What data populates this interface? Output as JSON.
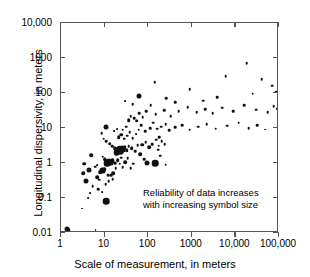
{
  "chart_data": {
    "type": "scatter",
    "title": "",
    "xlabel": "Scale of measurement, in meters",
    "ylabel": "Longitudinal dispersivity, in meters",
    "xscale": "log",
    "yscale": "log",
    "xlim": [
      1,
      100000
    ],
    "ylim": [
      0.01,
      10000
    ],
    "grid": false,
    "legend": "none",
    "xticks": [
      "1",
      "10",
      "100",
      "1000",
      "10,000",
      "100,000"
    ],
    "xtick_values": [
      1,
      10,
      100,
      1000,
      10000,
      100000
    ],
    "yticks": [
      "0.01",
      "0.1",
      "1",
      "10",
      "100",
      "1000",
      "10,000"
    ],
    "ytick_values": [
      0.01,
      0.1,
      1,
      10,
      100,
      1000,
      10000
    ],
    "annotations": [
      {
        "line1": "Reliability of data increases",
        "line2": "with increasing symbol size"
      }
    ],
    "symbol_size_meaning": "Reliability of data increases with increasing symbol size",
    "marker_color": "#111111",
    "size_classes": [
      1.8,
      2.6,
      3.6,
      5.0,
      6.6
    ],
    "points": [
      {
        "x": 1.4,
        "y": 0.013,
        "s": 5.0
      },
      {
        "x": 1.5,
        "y": 0.012,
        "s": 3.6
      },
      {
        "x": 3.0,
        "y": 0.05,
        "s": 1.8
      },
      {
        "x": 6.2,
        "y": 0.012,
        "s": 1.8
      },
      {
        "x": 4.2,
        "y": 0.1,
        "s": 1.8
      },
      {
        "x": 4.6,
        "y": 0.14,
        "s": 1.8
      },
      {
        "x": 5.3,
        "y": 0.22,
        "s": 2.6
      },
      {
        "x": 11.0,
        "y": 0.082,
        "s": 6.6
      },
      {
        "x": 6.8,
        "y": 0.4,
        "s": 3.6
      },
      {
        "x": 3.2,
        "y": 0.52,
        "s": 3.6
      },
      {
        "x": 3.4,
        "y": 0.95,
        "s": 3.6
      },
      {
        "x": 7.5,
        "y": 0.33,
        "s": 2.6
      },
      {
        "x": 8.0,
        "y": 0.55,
        "s": 3.6
      },
      {
        "x": 8.6,
        "y": 0.62,
        "s": 5.0
      },
      {
        "x": 9.2,
        "y": 0.58,
        "s": 5.0
      },
      {
        "x": 9.8,
        "y": 0.66,
        "s": 3.6
      },
      {
        "x": 6.0,
        "y": 0.78,
        "s": 2.6
      },
      {
        "x": 6.6,
        "y": 0.88,
        "s": 1.8
      },
      {
        "x": 10.5,
        "y": 0.25,
        "s": 2.6
      },
      {
        "x": 12.5,
        "y": 0.3,
        "s": 2.6
      },
      {
        "x": 14.0,
        "y": 0.44,
        "s": 2.6
      },
      {
        "x": 16.0,
        "y": 0.52,
        "s": 3.6
      },
      {
        "x": 18.0,
        "y": 0.7,
        "s": 2.6
      },
      {
        "x": 11.5,
        "y": 1.0,
        "s": 6.6
      },
      {
        "x": 12.2,
        "y": 1.05,
        "s": 6.6
      },
      {
        "x": 13.0,
        "y": 1.1,
        "s": 6.6
      },
      {
        "x": 13.8,
        "y": 0.98,
        "s": 5.0
      },
      {
        "x": 14.6,
        "y": 1.15,
        "s": 5.0
      },
      {
        "x": 15.5,
        "y": 1.25,
        "s": 3.6
      },
      {
        "x": 10.0,
        "y": 1.3,
        "s": 3.6
      },
      {
        "x": 9.0,
        "y": 1.5,
        "s": 2.6
      },
      {
        "x": 17.5,
        "y": 1.0,
        "s": 2.6
      },
      {
        "x": 20.0,
        "y": 1.2,
        "s": 3.6
      },
      {
        "x": 22.0,
        "y": 0.95,
        "s": 2.6
      },
      {
        "x": 24.0,
        "y": 1.4,
        "s": 2.6
      },
      {
        "x": 26.0,
        "y": 0.75,
        "s": 2.6
      },
      {
        "x": 30.0,
        "y": 1.05,
        "s": 3.6
      },
      {
        "x": 34.0,
        "y": 1.35,
        "s": 2.6
      },
      {
        "x": 40.0,
        "y": 0.7,
        "s": 2.6
      },
      {
        "x": 46.0,
        "y": 0.95,
        "s": 2.6
      },
      {
        "x": 95.0,
        "y": 1.0,
        "s": 5.0
      },
      {
        "x": 145.0,
        "y": 1.0,
        "s": 6.6
      },
      {
        "x": 19.0,
        "y": 2.0,
        "s": 6.6
      },
      {
        "x": 20.5,
        "y": 2.3,
        "s": 6.6
      },
      {
        "x": 22.0,
        "y": 2.5,
        "s": 6.6
      },
      {
        "x": 23.5,
        "y": 2.2,
        "s": 6.6
      },
      {
        "x": 25.0,
        "y": 2.6,
        "s": 5.0
      },
      {
        "x": 27.0,
        "y": 2.4,
        "s": 5.0
      },
      {
        "x": 29.0,
        "y": 2.8,
        "s": 3.6
      },
      {
        "x": 17.0,
        "y": 2.6,
        "s": 3.6
      },
      {
        "x": 15.0,
        "y": 3.0,
        "s": 2.6
      },
      {
        "x": 13.0,
        "y": 3.6,
        "s": 3.6
      },
      {
        "x": 11.0,
        "y": 4.2,
        "s": 2.6
      },
      {
        "x": 9.5,
        "y": 5.0,
        "s": 2.6
      },
      {
        "x": 32.0,
        "y": 2.3,
        "s": 3.6
      },
      {
        "x": 36.0,
        "y": 3.0,
        "s": 2.6
      },
      {
        "x": 42.0,
        "y": 2.6,
        "s": 3.6
      },
      {
        "x": 50.0,
        "y": 2.2,
        "s": 2.6
      },
      {
        "x": 58.0,
        "y": 3.2,
        "s": 2.6
      },
      {
        "x": 21.0,
        "y": 5.5,
        "s": 3.6
      },
      {
        "x": 24.0,
        "y": 6.5,
        "s": 3.6
      },
      {
        "x": 28.0,
        "y": 5.0,
        "s": 2.6
      },
      {
        "x": 33.0,
        "y": 6.0,
        "s": 2.6
      },
      {
        "x": 38.0,
        "y": 7.5,
        "s": 2.6
      },
      {
        "x": 44.0,
        "y": 5.2,
        "s": 2.6
      },
      {
        "x": 52.0,
        "y": 6.8,
        "s": 1.8
      },
      {
        "x": 16.5,
        "y": 8.0,
        "s": 1.8
      },
      {
        "x": 19.5,
        "y": 9.5,
        "s": 1.8
      },
      {
        "x": 26.0,
        "y": 9.0,
        "s": 2.6
      },
      {
        "x": 31.0,
        "y": 11.0,
        "s": 2.6
      },
      {
        "x": 10.5,
        "y": 11.0,
        "s": 5.0
      },
      {
        "x": 8.5,
        "y": 7.0,
        "s": 2.6
      },
      {
        "x": 60.0,
        "y": 9.0,
        "s": 2.6
      },
      {
        "x": 70.0,
        "y": 12.0,
        "s": 2.6
      },
      {
        "x": 85.0,
        "y": 8.0,
        "s": 2.6
      },
      {
        "x": 110.0,
        "y": 10.0,
        "s": 2.6
      },
      {
        "x": 130.0,
        "y": 14.0,
        "s": 2.6
      },
      {
        "x": 160.0,
        "y": 9.5,
        "s": 2.6
      },
      {
        "x": 200.0,
        "y": 11.0,
        "s": 2.6
      },
      {
        "x": 250.0,
        "y": 13.0,
        "s": 2.6
      },
      {
        "x": 300.0,
        "y": 8.5,
        "s": 2.6
      },
      {
        "x": 420.0,
        "y": 10.5,
        "s": 2.6
      },
      {
        "x": 600.0,
        "y": 12.0,
        "s": 2.6
      },
      {
        "x": 900.0,
        "y": 9.0,
        "s": 2.6
      },
      {
        "x": 1400.0,
        "y": 11.0,
        "s": 2.6
      },
      {
        "x": 2200.0,
        "y": 13.0,
        "s": 2.6
      },
      {
        "x": 3500.0,
        "y": 9.5,
        "s": 2.6
      },
      {
        "x": 6500.0,
        "y": 11.5,
        "s": 2.6
      },
      {
        "x": 12000.0,
        "y": 14.0,
        "s": 2.6
      },
      {
        "x": 20000.0,
        "y": 10.0,
        "s": 2.6
      },
      {
        "x": 32000.0,
        "y": 12.0,
        "s": 2.6
      },
      {
        "x": 48000.0,
        "y": 9.0,
        "s": 1.8
      },
      {
        "x": 150.0,
        "y": 25.0,
        "s": 2.6
      },
      {
        "x": 230.0,
        "y": 32.0,
        "s": 2.6
      },
      {
        "x": 330.0,
        "y": 22.0,
        "s": 2.6
      },
      {
        "x": 500.0,
        "y": 30.0,
        "s": 2.6
      },
      {
        "x": 800.0,
        "y": 40.0,
        "s": 2.6
      },
      {
        "x": 1300.0,
        "y": 28.0,
        "s": 2.6
      },
      {
        "x": 2000.0,
        "y": 35.0,
        "s": 2.6
      },
      {
        "x": 3000.0,
        "y": 26.0,
        "s": 2.6
      },
      {
        "x": 5000.0,
        "y": 38.0,
        "s": 2.6
      },
      {
        "x": 9000.0,
        "y": 30.0,
        "s": 2.6
      },
      {
        "x": 16000.0,
        "y": 45.0,
        "s": 2.6
      },
      {
        "x": 30000.0,
        "y": 33.0,
        "s": 2.6
      },
      {
        "x": 55000.0,
        "y": 28.0,
        "s": 2.6
      },
      {
        "x": 75000.0,
        "y": 42.0,
        "s": 2.6
      },
      {
        "x": 90000.0,
        "y": 36.0,
        "s": 2.6
      },
      {
        "x": 62.0,
        "y": 80.0,
        "s": 5.0
      },
      {
        "x": 140.0,
        "y": 200.0,
        "s": 2.6
      },
      {
        "x": 900.0,
        "y": 130.0,
        "s": 2.6
      },
      {
        "x": 6000.0,
        "y": 300.0,
        "s": 2.6
      },
      {
        "x": 18000.0,
        "y": 700.0,
        "s": 2.6
      },
      {
        "x": 40000.0,
        "y": 250.0,
        "s": 2.6
      },
      {
        "x": 70000.0,
        "y": 160.0,
        "s": 2.6
      },
      {
        "x": 85000.0,
        "y": 110.0,
        "s": 2.6
      },
      {
        "x": 25000.0,
        "y": 95.0,
        "s": 2.6
      },
      {
        "x": 3800.0,
        "y": 75.0,
        "s": 2.6
      },
      {
        "x": 1800.0,
        "y": 60.0,
        "s": 2.6
      },
      {
        "x": 420.0,
        "y": 55.0,
        "s": 2.6
      },
      {
        "x": 260.0,
        "y": 70.0,
        "s": 2.6
      },
      {
        "x": 75.0,
        "y": 20.0,
        "s": 2.6
      },
      {
        "x": 55.0,
        "y": 16.0,
        "s": 3.6
      },
      {
        "x": 48.0,
        "y": 19.0,
        "s": 2.6
      },
      {
        "x": 40.0,
        "y": 22.0,
        "s": 2.6
      },
      {
        "x": 36.0,
        "y": 17.0,
        "s": 3.6
      },
      {
        "x": 62.0,
        "y": 26.0,
        "s": 2.6
      },
      {
        "x": 90.0,
        "y": 30.0,
        "s": 2.6
      },
      {
        "x": 115.0,
        "y": 45.0,
        "s": 2.6
      },
      {
        "x": 44.0,
        "y": 48.0,
        "s": 2.6
      },
      {
        "x": 30.0,
        "y": 60.0,
        "s": 1.8
      },
      {
        "x": 250.0,
        "y": 0.9,
        "s": 2.6
      },
      {
        "x": 190.0,
        "y": 1.6,
        "s": 2.6
      },
      {
        "x": 170.0,
        "y": 2.4,
        "s": 2.6
      },
      {
        "x": 175.0,
        "y": 3.1,
        "s": 2.6
      },
      {
        "x": 205.0,
        "y": 4.2,
        "s": 2.6
      },
      {
        "x": 240.0,
        "y": 3.4,
        "s": 2.6
      },
      {
        "x": 180.0,
        "y": 5.5,
        "s": 2.6
      },
      {
        "x": 155.0,
        "y": 4.6,
        "s": 2.6
      },
      {
        "x": 125.0,
        "y": 3.5,
        "s": 2.6
      },
      {
        "x": 105.0,
        "y": 2.8,
        "s": 3.6
      },
      {
        "x": 88.0,
        "y": 4.0,
        "s": 2.6
      },
      {
        "x": 72.0,
        "y": 3.3,
        "s": 3.6
      },
      {
        "x": 66.0,
        "y": 1.8,
        "s": 3.6
      },
      {
        "x": 80.0,
        "y": 1.3,
        "s": 2.6
      },
      {
        "x": 5.0,
        "y": 1.7,
        "s": 3.6
      },
      {
        "x": 4.4,
        "y": 0.62,
        "s": 5.0
      },
      {
        "x": 3.8,
        "y": 0.3,
        "s": 5.0
      },
      {
        "x": 7.2,
        "y": 0.18,
        "s": 2.6
      },
      {
        "x": 8.8,
        "y": 0.15,
        "s": 1.8
      },
      {
        "x": 12.0,
        "y": 0.45,
        "s": 2.6
      },
      {
        "x": 15.5,
        "y": 0.35,
        "s": 2.6
      }
    ]
  }
}
